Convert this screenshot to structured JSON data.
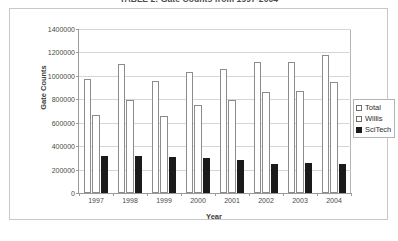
{
  "chart_data": {
    "type": "bar",
    "title": "TABLE 2: Gate Counts from 1997-2004",
    "xlabel": "Year",
    "ylabel": "Gate Counts",
    "categories": [
      "1997",
      "1998",
      "1999",
      "2000",
      "2001",
      "2002",
      "2003",
      "2004"
    ],
    "series": [
      {
        "name": "Total",
        "values": [
          975000,
          1100000,
          960000,
          1030000,
          1060000,
          1120000,
          1115000,
          1175000
        ]
      },
      {
        "name": "Willis",
        "values": [
          670000,
          790000,
          660000,
          750000,
          790000,
          860000,
          875000,
          950000
        ]
      },
      {
        "name": "SciTech",
        "values": [
          315000,
          320000,
          305000,
          295000,
          280000,
          250000,
          255000,
          248000
        ]
      }
    ],
    "ylim": [
      0,
      1400000
    ],
    "ytick_values": [
      0,
      200000,
      400000,
      600000,
      800000,
      1000000,
      1200000,
      1400000
    ],
    "ytick_labels": [
      "0",
      "200000",
      "400000",
      "600000",
      "800000",
      "1000000",
      "1200000",
      "1400000"
    ],
    "grid": true,
    "legend_position": "right",
    "series_colors": [
      "#ffffff",
      "#ffffff",
      "#1a1a1a"
    ],
    "series_border_colors": [
      "#8c8c8c",
      "#8c8c8c",
      "#1a1a1a"
    ]
  }
}
